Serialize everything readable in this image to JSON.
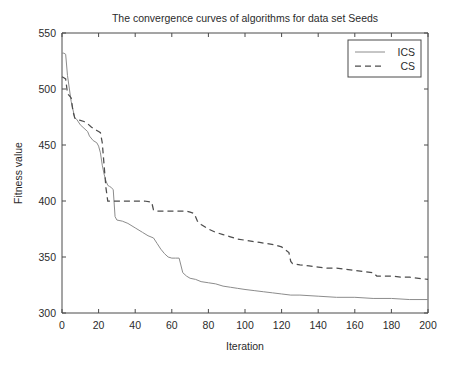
{
  "chart_data": {
    "type": "line",
    "title": "The convergence curves of algorithms for data set Seeds",
    "xlabel": "Iteration",
    "ylabel": "Fitness value",
    "xlim": [
      0,
      200
    ],
    "ylim": [
      300,
      550
    ],
    "xticks": [
      0,
      20,
      40,
      60,
      80,
      100,
      120,
      140,
      160,
      180,
      200
    ],
    "yticks": [
      300,
      350,
      400,
      450,
      500,
      550
    ],
    "grid": false,
    "legend_position": "top-right",
    "legend": [
      "ICS",
      "CS"
    ],
    "series": [
      {
        "name": "ICS",
        "style": "solid",
        "color": "#8c8c8c",
        "x": [
          0,
          1,
          2,
          3,
          5,
          7,
          8,
          10,
          12,
          14,
          15,
          17,
          19,
          20,
          21,
          22,
          23,
          24,
          25,
          26,
          27,
          28,
          29,
          30,
          33,
          36,
          40,
          44,
          47,
          50,
          52,
          54,
          56,
          58,
          60,
          62,
          64,
          66,
          68,
          70,
          73,
          76,
          80,
          84,
          88,
          92,
          96,
          100,
          105,
          110,
          115,
          120,
          125,
          130,
          140,
          150,
          160,
          170,
          180,
          190,
          200
        ],
        "y": [
          532,
          532,
          531,
          512,
          489,
          474,
          473,
          468,
          465,
          462,
          458,
          454,
          452,
          449,
          443,
          432,
          424,
          418,
          414,
          413,
          412,
          410,
          386,
          383,
          382,
          380,
          376,
          372,
          369,
          367,
          362,
          357,
          353,
          350,
          349,
          349,
          349,
          336,
          333,
          331,
          330,
          328,
          327,
          326,
          324,
          323,
          322,
          321,
          320,
          319,
          318,
          317,
          316,
          316,
          315,
          314,
          314,
          313,
          313,
          312,
          312
        ]
      },
      {
        "name": "CS",
        "style": "dashed",
        "color": "#4d4d4d",
        "x": [
          0,
          1,
          2,
          3,
          4,
          5,
          6,
          7,
          8,
          10,
          12,
          14,
          16,
          18,
          19,
          20,
          21,
          22,
          23,
          24,
          25,
          30,
          35,
          40,
          45,
          49,
          50,
          52,
          55,
          58,
          60,
          62,
          64,
          66,
          68,
          70,
          72,
          73,
          74,
          76,
          78,
          80,
          84,
          88,
          92,
          96,
          100,
          104,
          108,
          112,
          116,
          120,
          124,
          125,
          126,
          130,
          135,
          140,
          145,
          150,
          155,
          160,
          165,
          170,
          172,
          175,
          180,
          185,
          190,
          195,
          200
        ],
        "y": [
          511,
          510,
          509,
          496,
          494,
          492,
          480,
          474,
          473,
          472,
          471,
          469,
          466,
          464,
          463,
          462,
          461,
          452,
          432,
          412,
          400,
          400,
          400,
          400,
          400,
          399,
          392,
          391,
          391,
          391,
          391,
          391,
          391,
          391,
          391,
          390,
          389,
          386,
          382,
          379,
          377,
          375,
          372,
          370,
          368,
          366,
          365,
          364,
          363,
          362,
          361,
          359,
          354,
          346,
          344,
          343,
          342,
          341,
          340,
          340,
          339,
          338,
          337,
          336,
          333,
          333,
          333,
          332,
          332,
          331,
          330
        ]
      }
    ]
  },
  "axes": {
    "title_text": "The convergence curves of algorithms for data set Seeds",
    "x_axis_label": "Iteration",
    "y_axis_label": "Fitness value"
  }
}
